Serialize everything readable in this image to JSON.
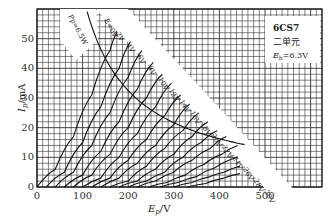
{
  "chart_data": {
    "type": "line",
    "xlabel": "Ep/V",
    "ylabel": "Ip/mA",
    "xlim": [
      0,
      625
    ],
    "ylim": [
      0,
      60
    ],
    "x_ticks": [
      0,
      100,
      200,
      300,
      400,
      500
    ],
    "y_ticks": [
      0,
      10,
      20,
      30,
      40,
      50
    ],
    "grid": true,
    "legend_position": "top-right",
    "info_box": {
      "tube": "6CS7",
      "unit": "二单元",
      "heater_label": "E",
      "heater_sub": "h",
      "heater_value": "=6.3V"
    },
    "dissipation_curve": {
      "label": "Pp=6.5W",
      "watts": 6.5,
      "x": [
        110,
        130,
        150,
        175,
        200,
        250,
        300,
        350,
        400,
        455
      ],
      "y": [
        59.1,
        50.0,
        43.3,
        37.1,
        32.5,
        26.0,
        21.7,
        18.6,
        16.3,
        14.3
      ]
    },
    "series": [
      {
        "name": "Eg=0V",
        "x0": 0,
        "x": [
          0,
          40,
          80,
          120,
          160,
          175
        ],
        "y": [
          0,
          6,
          17,
          31,
          46,
          52
        ]
      },
      {
        "name": "-2V",
        "x0": 20,
        "x": [
          20,
          60,
          100,
          140,
          180,
          205
        ],
        "y": [
          0,
          5,
          15,
          27,
          40,
          49
        ]
      },
      {
        "name": "-4V",
        "x0": 40,
        "x": [
          40,
          80,
          120,
          160,
          200,
          230
        ],
        "y": [
          0,
          5,
          14,
          25,
          37,
          46
        ]
      },
      {
        "name": "-6V",
        "x0": 60,
        "x": [
          60,
          100,
          140,
          180,
          220,
          255
        ],
        "y": [
          0,
          4,
          12,
          22,
          33,
          42
        ]
      },
      {
        "name": "-8V",
        "x0": 80,
        "x": [
          80,
          120,
          160,
          200,
          240,
          275
        ],
        "y": [
          0,
          4,
          11,
          20,
          30,
          38
        ]
      },
      {
        "name": "-10V",
        "x0": 100,
        "x": [
          100,
          140,
          180,
          220,
          260,
          295
        ],
        "y": [
          0,
          3,
          10,
          18,
          27,
          35
        ]
      },
      {
        "name": "-12V",
        "x0": 120,
        "x": [
          120,
          160,
          200,
          240,
          280,
          315
        ],
        "y": [
          0,
          3,
          9,
          16,
          24,
          31
        ]
      },
      {
        "name": "-14V",
        "x0": 140,
        "x": [
          140,
          180,
          220,
          260,
          300,
          335
        ],
        "y": [
          0,
          3,
          8,
          14,
          21,
          28
        ]
      },
      {
        "name": "-16V",
        "x0": 160,
        "x": [
          160,
          200,
          240,
          280,
          320,
          355
        ],
        "y": [
          0,
          2,
          7,
          13,
          19,
          25
        ]
      },
      {
        "name": "-18V",
        "x0": 180,
        "x": [
          180,
          220,
          260,
          300,
          340,
          375
        ],
        "y": [
          0,
          2,
          6,
          11,
          17,
          22
        ]
      },
      {
        "name": "-20V",
        "x0": 200,
        "x": [
          200,
          240,
          280,
          320,
          360,
          395
        ],
        "y": [
          0,
          2,
          5,
          10,
          15,
          19
        ]
      },
      {
        "name": "-22V",
        "x0": 220,
        "x": [
          220,
          260,
          300,
          340,
          380,
          415
        ],
        "y": [
          0,
          2,
          5,
          9,
          13,
          17
        ]
      },
      {
        "name": "-24V",
        "x0": 245,
        "x": [
          245,
          285,
          325,
          365,
          405,
          440
        ],
        "y": [
          0,
          1.5,
          4,
          7.5,
          11,
          14
        ]
      },
      {
        "name": "-26V",
        "x0": 270,
        "x": [
          270,
          310,
          350,
          390,
          440
        ],
        "y": [
          0,
          1.5,
          3.5,
          6.5,
          10
        ]
      },
      {
        "name": "-28V",
        "x0": 300,
        "x": [
          300,
          340,
          380,
          410,
          445
        ],
        "y": [
          0,
          1.5,
          3.5,
          5,
          7
        ]
      },
      {
        "name": "-30V",
        "x0": 330,
        "x": [
          330,
          370,
          410,
          445
        ],
        "y": [
          0,
          1.2,
          3,
          4.5
        ]
      }
    ],
    "curve_labels": [
      "E=0V",
      "-2V",
      "-4V",
      "-6V",
      "-8V",
      "-10V",
      "-12V",
      "-14V",
      "-16V",
      "-18V",
      "-20V",
      "-22V",
      "-24V",
      "-26V",
      "-28V",
      "-30V"
    ]
  },
  "style": {
    "line_color": "#111111",
    "grid_color": "#333333",
    "background": "#ffffff",
    "label_bg": "#ffffff"
  }
}
